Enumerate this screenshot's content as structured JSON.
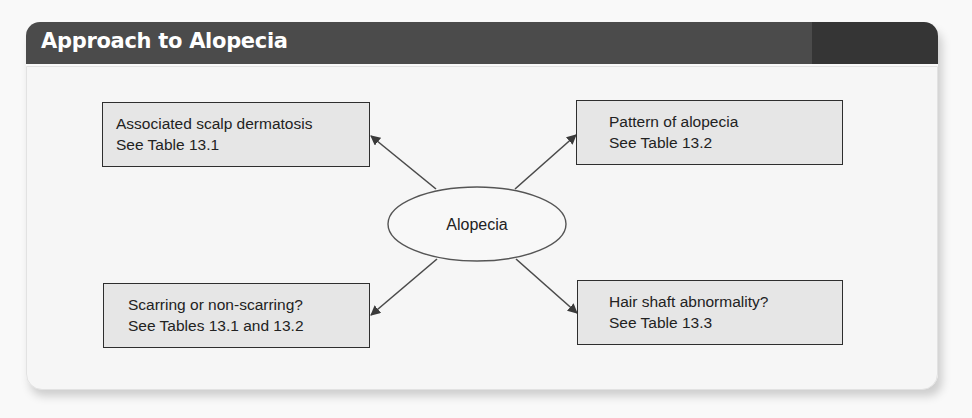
{
  "header": {
    "title": "Approach to Alopecia"
  },
  "diagram": {
    "center": {
      "label": "Alopecia"
    },
    "nodes": [
      {
        "id": "top-left",
        "line1": "Associated scalp dermatosis",
        "line2": "See Table 13.1"
      },
      {
        "id": "top-right",
        "line1": "Pattern of alopecia",
        "line2": "See Table 13.2"
      },
      {
        "id": "bottom-left",
        "line1": "Scarring or non-scarring?",
        "line2": "See Tables 13.1 and 13.2"
      },
      {
        "id": "bottom-right",
        "line1": "Hair shaft abnormality?",
        "line2": "See Table 13.3"
      }
    ],
    "edges": [
      {
        "from": "Alopecia",
        "to": "top-left"
      },
      {
        "from": "Alopecia",
        "to": "top-right"
      },
      {
        "from": "Alopecia",
        "to": "bottom-left"
      },
      {
        "from": "Alopecia",
        "to": "bottom-right"
      }
    ]
  },
  "colors": {
    "header_bg": "#4b4b4b",
    "header_accent": "#353535",
    "panel_bg": "#f6f6f6",
    "box_fill": "#e6e6e6",
    "stroke": "#3a3a3a"
  }
}
